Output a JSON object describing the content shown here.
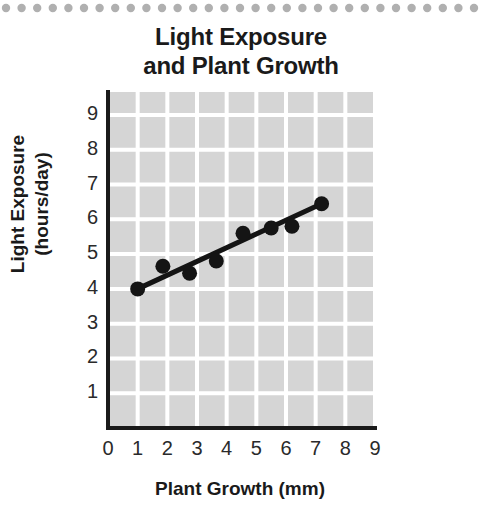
{
  "title": {
    "line1": "Light Exposure",
    "line2": "and Plant Growth"
  },
  "decoration": {
    "top_border": "dotted-rule",
    "dot_color": "#b0b0b0"
  },
  "colors": {
    "plot_background": "#d5d5d5",
    "gridline": "#ffffff",
    "axis": "#1a1a1a",
    "marker": "#141414",
    "trend_line": "#141414",
    "text": "#1a1a1a",
    "page_background": "#ffffff"
  },
  "chart_data": {
    "type": "scatter",
    "title": "Light Exposure and Plant Growth",
    "xlabel": "Plant Growth (mm)",
    "ylabel": "Light Exposure (hours/day)",
    "xlim": [
      0,
      9
    ],
    "ylim": [
      0,
      9.3
    ],
    "grid": true,
    "legend": null,
    "xticks": [
      0,
      1,
      2,
      3,
      4,
      5,
      6,
      7,
      8,
      9
    ],
    "yticks": [
      1,
      2,
      3,
      4,
      5,
      6,
      7,
      8,
      9
    ],
    "xtick_labels": [
      "0",
      "1",
      "2",
      "3",
      "4",
      "5",
      "6",
      "7",
      "8",
      "9"
    ],
    "ytick_labels": [
      "1",
      "2",
      "3",
      "4",
      "5",
      "6",
      "7",
      "8",
      "9"
    ],
    "series": [
      {
        "name": "observations",
        "type": "scatter",
        "marker": "circle",
        "points": [
          {
            "x": 1.0,
            "y": 4.0
          },
          {
            "x": 1.85,
            "y": 4.65
          },
          {
            "x": 2.75,
            "y": 4.45
          },
          {
            "x": 3.65,
            "y": 4.8
          },
          {
            "x": 4.55,
            "y": 5.6
          },
          {
            "x": 5.5,
            "y": 5.75
          },
          {
            "x": 6.2,
            "y": 5.8
          },
          {
            "x": 7.2,
            "y": 6.45
          }
        ]
      },
      {
        "name": "trend-line",
        "type": "line",
        "points": [
          {
            "x": 1.0,
            "y": 4.0
          },
          {
            "x": 7.2,
            "y": 6.45
          }
        ]
      }
    ]
  }
}
